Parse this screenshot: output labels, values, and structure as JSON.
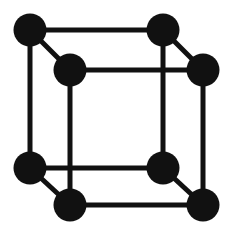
{
  "figure": {
    "type": "crystal-lattice-diagram",
    "lattice_type": "simple cubic",
    "projection": "oblique (cavalier)",
    "width": 235,
    "height": 237,
    "background_color": "#ffffff",
    "atom_color": "#111111",
    "bond_color": "#111111",
    "atom_radius": 16.5,
    "bond_width": 5,
    "atom_count": 8,
    "bond_count": 12,
    "depth_offset_x": 40,
    "depth_offset_y": 40,
    "cube_edge_px": 133
  },
  "atoms": [
    {
      "id": "back-top-left",
      "label": "A",
      "cx": 30,
      "cy": 30,
      "r": 16.5,
      "face": "back",
      "color": "#111111"
    },
    {
      "id": "back-top-right",
      "label": "B",
      "cx": 163,
      "cy": 30,
      "r": 16.5,
      "face": "back",
      "color": "#111111"
    },
    {
      "id": "back-bottom-left",
      "label": "C",
      "cx": 30,
      "cy": 168,
      "r": 16.5,
      "face": "back",
      "color": "#111111"
    },
    {
      "id": "back-bottom-right",
      "label": "D",
      "cx": 163,
      "cy": 168,
      "r": 16.5,
      "face": "back",
      "color": "#111111"
    },
    {
      "id": "front-top-left",
      "label": "E",
      "cx": 70,
      "cy": 70,
      "r": 16.5,
      "face": "front",
      "color": "#111111"
    },
    {
      "id": "front-top-right",
      "label": "F",
      "cx": 203,
      "cy": 70,
      "r": 16.5,
      "face": "front",
      "color": "#111111"
    },
    {
      "id": "front-bottom-left",
      "label": "G",
      "cx": 70,
      "cy": 205,
      "r": 16.5,
      "face": "front",
      "color": "#111111"
    },
    {
      "id": "front-bottom-right",
      "label": "H",
      "cx": 203,
      "cy": 205,
      "r": 16.5,
      "face": "front",
      "color": "#111111"
    }
  ],
  "bonds": [
    {
      "id": "back-top-edge",
      "from": "back-top-left",
      "to": "back-top-right",
      "x1": 30,
      "y1": 30,
      "x2": 163,
      "y2": 30,
      "orientation": "horizontal",
      "width": 5,
      "color": "#111111"
    },
    {
      "id": "back-bottom-edge",
      "from": "back-bottom-left",
      "to": "back-bottom-right",
      "x1": 30,
      "y1": 168,
      "x2": 163,
      "y2": 168,
      "orientation": "horizontal",
      "width": 5,
      "color": "#111111"
    },
    {
      "id": "back-left-edge",
      "from": "back-top-left",
      "to": "back-bottom-left",
      "x1": 30,
      "y1": 30,
      "x2": 30,
      "y2": 168,
      "orientation": "vertical",
      "width": 5,
      "color": "#111111"
    },
    {
      "id": "back-right-edge",
      "from": "back-top-right",
      "to": "back-bottom-right",
      "x1": 163,
      "y1": 30,
      "x2": 163,
      "y2": 168,
      "orientation": "vertical",
      "width": 5,
      "color": "#111111"
    },
    {
      "id": "front-top-edge",
      "from": "front-top-left",
      "to": "front-top-right",
      "x1": 70,
      "y1": 70,
      "x2": 203,
      "y2": 70,
      "orientation": "horizontal",
      "width": 5,
      "color": "#111111"
    },
    {
      "id": "front-bottom-edge",
      "from": "front-bottom-left",
      "to": "front-bottom-right",
      "x1": 70,
      "y1": 205,
      "x2": 203,
      "y2": 205,
      "orientation": "horizontal",
      "width": 5,
      "color": "#111111"
    },
    {
      "id": "front-left-edge",
      "from": "front-top-left",
      "to": "front-bottom-left",
      "x1": 70,
      "y1": 70,
      "x2": 70,
      "y2": 205,
      "orientation": "vertical",
      "width": 5,
      "color": "#111111"
    },
    {
      "id": "front-right-edge",
      "from": "front-top-right",
      "to": "front-bottom-right",
      "x1": 203,
      "y1": 70,
      "x2": 203,
      "y2": 205,
      "orientation": "vertical",
      "width": 5,
      "color": "#111111"
    },
    {
      "id": "depth-edge-top-left",
      "from": "back-top-left",
      "to": "front-top-left",
      "x1": 30,
      "y1": 30,
      "x2": 70,
      "y2": 70,
      "orientation": "diagonal",
      "width": 5,
      "color": "#111111"
    },
    {
      "id": "depth-edge-top-right",
      "from": "back-top-right",
      "to": "front-top-right",
      "x1": 163,
      "y1": 30,
      "x2": 203,
      "y2": 70,
      "orientation": "diagonal",
      "width": 5,
      "color": "#111111"
    },
    {
      "id": "depth-edge-bot-left",
      "from": "back-bottom-left",
      "to": "front-bottom-left",
      "x1": 30,
      "y1": 168,
      "x2": 70,
      "y2": 205,
      "orientation": "diagonal",
      "width": 5,
      "color": "#111111"
    },
    {
      "id": "depth-edge-bot-right",
      "from": "back-bottom-right",
      "to": "front-bottom-right",
      "x1": 163,
      "y1": 168,
      "x2": 203,
      "y2": 205,
      "orientation": "diagonal",
      "width": 5,
      "color": "#111111"
    }
  ]
}
